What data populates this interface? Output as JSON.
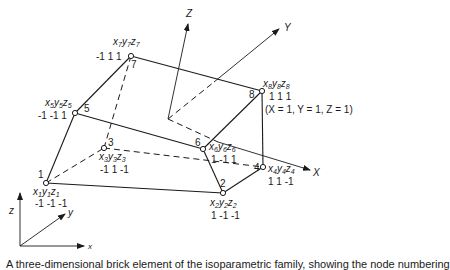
{
  "figure": {
    "caption_partial": "A three-dimensional brick element of the isoparametric family, showing the node numbering",
    "global_axes": {
      "X": "X",
      "Y": "Y",
      "Z": "Z"
    },
    "reference_axes": {
      "x": "x",
      "y": "y",
      "z": "z"
    },
    "corner_note": "(X = 1, Y = 1, Z = 1)",
    "nodes": [
      {
        "id": "1",
        "coord_label": "x1y1z1",
        "x": "x",
        "y": "y",
        "z": "z",
        "sub": "1",
        "values": "-1 -1 -1"
      },
      {
        "id": "2",
        "coord_label": "x2y2z2",
        "x": "x",
        "y": "y",
        "z": "z",
        "sub": "2",
        "values": "1 -1 -1"
      },
      {
        "id": "3",
        "coord_label": "x3y3z3",
        "x": "x",
        "y": "y",
        "z": "z",
        "sub": "3",
        "values": "-1 1 -1"
      },
      {
        "id": "4",
        "coord_label": "x4y4z4",
        "x": "x",
        "y": "y",
        "z": "z",
        "sub": "4",
        "values": "1 1 -1"
      },
      {
        "id": "5",
        "coord_label": "x5y5z5",
        "x": "x",
        "y": "y",
        "z": "z",
        "sub": "5",
        "values": "-1 -1 1"
      },
      {
        "id": "6",
        "coord_label": "x6y6z6",
        "x": "x",
        "y": "y",
        "z": "z",
        "sub": "6",
        "values": "1 -1 1"
      },
      {
        "id": "7",
        "coord_label": "x7y7z7",
        "x": "x",
        "y": "y",
        "z": "z",
        "sub": "7",
        "values": "-1 1 1"
      },
      {
        "id": "8",
        "coord_label": "x8y8z8",
        "x": "x",
        "y": "y",
        "z": "z",
        "sub": "8",
        "values": "1 1 1"
      }
    ]
  }
}
